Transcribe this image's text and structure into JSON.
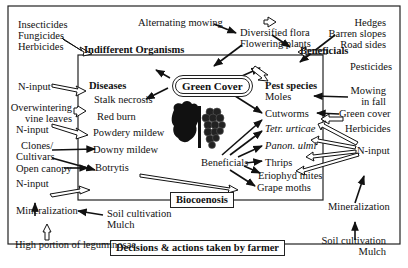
{
  "frame": {
    "outer_label": "Decisions & actions taken by farmer",
    "inner_label": "Biocoenosis"
  },
  "center": {
    "title": "Green Cover",
    "image": "grapevine-leaf-and-grape-cluster"
  },
  "headings": {
    "indifferent": "Indifferent Organisms",
    "beneficials": "Beneficials",
    "diseases": "Diseases",
    "pest_species": "Pest species"
  },
  "top": {
    "alternating_mowing": "Alternating mowing",
    "diversified_flora": "Diversified flora",
    "flowering_plants": "Flowering plants",
    "hedges": "Hedges",
    "barren_slopes": "Barren slopes",
    "road_sides": "Road sides",
    "pesticides": "Pesticides"
  },
  "left_inputs": {
    "insecticides": "Insecticides",
    "fungicides": "Fungicides",
    "herbicides": "Herbicides",
    "n_input_1": "N-input",
    "overwintering_1": "Overwintering",
    "overwintering_2": "vine leaves",
    "n_input_2": "N-input",
    "clones_1": "Clones/",
    "clones_2": "Cultivars",
    "open_canopy": "Open canopy",
    "n_input_3": "N-input",
    "mineralization": "Mineralization",
    "soil_cultivation": "Soil cultivation",
    "mulch": "Mulch",
    "leguminosae": "High portion of leguminosae"
  },
  "diseases": {
    "items": [
      "Stalk necrosis",
      "Red burn",
      "Powdery mildew",
      "Downy mildew",
      "Botrytis"
    ]
  },
  "pests": {
    "moles": "Moles",
    "cutworms": "Cutworms",
    "tetr": "Tetr. urticae",
    "panon": "Panon. ulmi",
    "thrips": "Thrips",
    "eriophyd": "Eriophyd mites",
    "grape_moths": "Grape moths",
    "beneficials": "Beneficials"
  },
  "right_inputs": {
    "mowing_1": "Mowing",
    "mowing_2": "in fall",
    "green_cover": "Green cover",
    "herbicides": "Herbicides",
    "n_input": "N-input",
    "mineralization": "Mineralization",
    "soil_cultivation": "Soil cultivation",
    "mulch": "Mulch"
  }
}
